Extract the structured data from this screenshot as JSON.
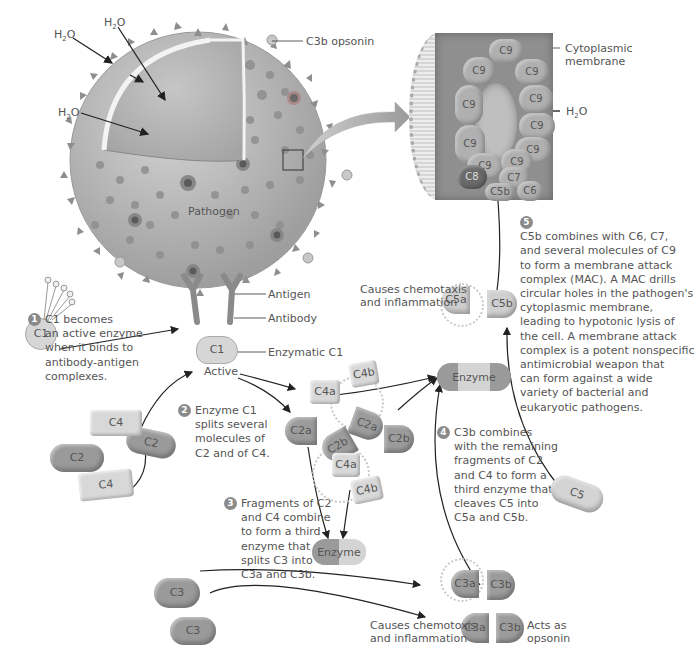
{
  "colors": {
    "pathogen": "#b4b4b4",
    "pathogen_spots": "#8e8e8e",
    "dark_protein": "#9a9a9a",
    "light_protein": "#d6d6d6",
    "badge": "#8a8a8a",
    "arrow": "#222222",
    "text": "#555555"
  },
  "pathogen": {
    "label": "Pathogen",
    "water_labels": [
      "H2O",
      "H2O",
      "H2O"
    ],
    "c3b_opsonin_label": "C3b opsonin",
    "antigen_label": "Antigen",
    "antibody_label": "Antibody"
  },
  "mac": {
    "cytoplasmic_membrane_label": "Cytoplasmic membrane",
    "water_label": "H2O",
    "subunits": [
      "C9",
      "C9",
      "C9",
      "C9",
      "C9",
      "C9",
      "C9",
      "C9",
      "C9",
      "C9",
      "C8",
      "C7",
      "C6",
      "C5b"
    ]
  },
  "c1": {
    "inactive_label": "C1",
    "active_label": "C1",
    "active_caption": "Active",
    "enzymatic_label": "Enzymatic C1"
  },
  "steps": [
    {
      "number": "1",
      "text": "C1 becomes\nan active enzyme\nwhen it binds to\nantibody-antigen\ncomplexes."
    },
    {
      "number": "2",
      "text": "Enzyme C1\nsplits several\nmolecules of\nC2 and of C4."
    },
    {
      "number": "3",
      "text": "Fragments of C2\nand C4 combine\nto form a third\nenzyme that\nsplits C3 into\nC3a and C3b."
    },
    {
      "number": "4",
      "text": "C3b combines\nwith the remaining\nfragments of C2\nand C4 to form a\nthird enzyme that\ncleaves C5 into\nC5a and C5b."
    },
    {
      "number": "5",
      "text": "C5b combines with C6, C7,\nand several molecules of C9\nto form a membrane attack\ncomplex (MAC). A MAC drills\ncircular holes in the pathogen's\ncytoplasmic membrane,\nleading to hypotonic lysis of\nthe cell. A membrane attack\ncomplex is a potent nonspecific\nantimicrobial weapon that\ncan form against a wide\nvariety of bacterial and\neukaryotic pathogens."
    }
  ],
  "molecules": {
    "c4_a": "C4",
    "c2_a": "C2",
    "c2_b": "C2",
    "c4_b": "C4",
    "c4a_1": "C4a",
    "c4b_1": "C4b",
    "c2a_1": "C2a",
    "c2b_1": "C2b",
    "c2a_2": "C2a",
    "c2b_2": "C2b",
    "c4a_2": "C4a",
    "c4b_2": "C4b",
    "enzyme_1": "Enzyme",
    "enzyme_2": "Enzyme",
    "c3_a": "C3",
    "c3_b": "C3",
    "c3a_1": "C3a",
    "c3b_1": "C3b",
    "c3a_2": "C3a",
    "c3b_2": "C3b",
    "c5": "C5",
    "c5a": "C5a",
    "c5b": "C5b"
  },
  "annotations": {
    "c5a_effect": "Causes chemotaxis\nand inflammation",
    "c3a_effect": "Causes chemotoxis\nand inflammation",
    "c3b_effect": "Acts as\nopsonin"
  }
}
